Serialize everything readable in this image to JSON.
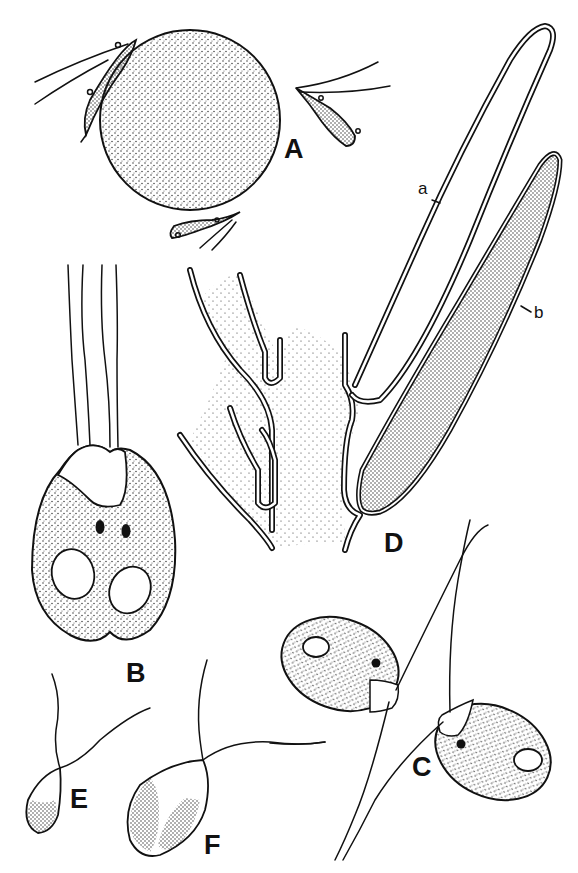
{
  "figure": {
    "colors": {
      "ink": "#111111",
      "background": "#ffffff"
    },
    "panels": [
      {
        "id": "A",
        "label": "A"
      },
      {
        "id": "B",
        "label": "B"
      },
      {
        "id": "C",
        "label": "C"
      },
      {
        "id": "D",
        "label": "D"
      },
      {
        "id": "E",
        "label": "E"
      },
      {
        "id": "F",
        "label": "F"
      }
    ],
    "part_labels": [
      {
        "id": "a",
        "label": "a"
      },
      {
        "id": "b",
        "label": "b"
      }
    ]
  }
}
